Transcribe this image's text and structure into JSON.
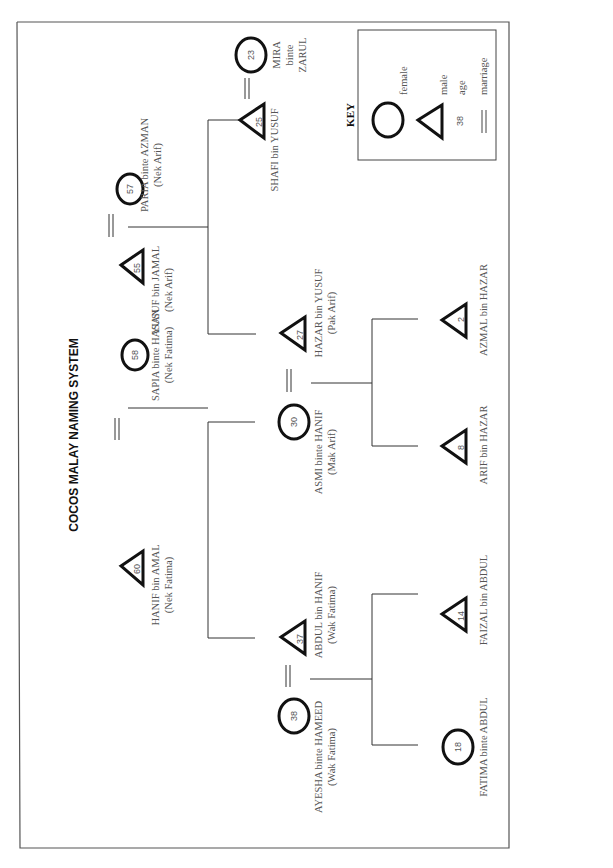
{
  "title": "COCOS MALAY NAMING SYSTEM",
  "key": {
    "title": "KEY",
    "female": "female",
    "male": "male",
    "age_sample": "38",
    "age": "age",
    "marriage": "marriage"
  },
  "people": {
    "hanif": {
      "name": "HANIF bin AMAL",
      "alias": "(Nek Fatima)",
      "age": "60",
      "sex": "male"
    },
    "sapia": {
      "name": "SAPIA binte HASAN",
      "alias": "(Nek Fatima)",
      "age": "58",
      "sex": "female"
    },
    "yusuf": {
      "name": "YUSUF bin JAMAL",
      "alias": "(Nek Arif)",
      "age": "55",
      "sex": "male"
    },
    "paria": {
      "name": "PARIA binte AZMAN",
      "alias": "(Nek Arif)",
      "age": "57",
      "sex": "female"
    },
    "ayesha": {
      "name": "AYESHA binte HAMEED",
      "alias": "(Wak Fatima)",
      "age": "38",
      "sex": "female"
    },
    "abdul": {
      "name": "ABDUL bin HANIF",
      "alias": "(Wak Fatima)",
      "age": "37",
      "sex": "male"
    },
    "asmi": {
      "name": "ASMI binte HANIF",
      "alias": "(Mak Arif)",
      "age": "30",
      "sex": "female"
    },
    "hazar": {
      "name": "HAZAR bin YUSUF",
      "alias": "(Pak Arif)",
      "age": "27",
      "sex": "male"
    },
    "shafi": {
      "name": "SHAFI bin YUSUF",
      "alias": "",
      "age": "25",
      "sex": "male"
    },
    "mira": {
      "name_l1": "MIRA",
      "name_l2": "binte",
      "name_l3": "ZARUL",
      "age": "23",
      "sex": "female"
    },
    "fatima": {
      "name": "FATIMA binte ABDUL",
      "age": "18",
      "sex": "female"
    },
    "faizal": {
      "name": "FAIZAL bin ABDUL",
      "age": "14",
      "sex": "male"
    },
    "arif": {
      "name": "ARIF bin HAZAR",
      "age": "8",
      "sex": "male"
    },
    "azmal": {
      "name": "AZMAL bin HAZAR",
      "age": "2",
      "sex": "male"
    }
  }
}
